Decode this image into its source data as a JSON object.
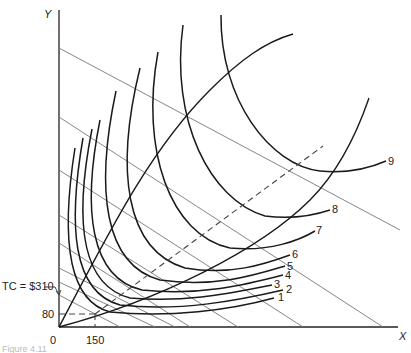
{
  "diagram": {
    "axes": {
      "x_label": "X",
      "y_label": "Y",
      "origin_label": "0"
    },
    "annotations": {
      "tc_label": "TC = $310",
      "y_tick": "80",
      "x_tick": "150"
    },
    "isoquant_labels": [
      "1",
      "2",
      "3",
      "4",
      "5",
      "6",
      "7",
      "8",
      "9"
    ],
    "caption": "Figure 4.11",
    "colors": {
      "curve": "#1a1a1a",
      "isocost": "#777777",
      "background": "#ffffff"
    }
  }
}
